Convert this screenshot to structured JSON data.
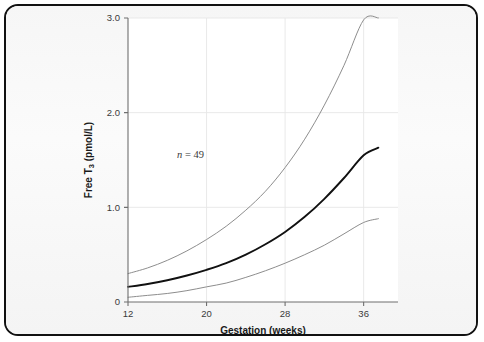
{
  "figure": {
    "border_color": "#111111",
    "plot_background": "#ffffff",
    "panel_background": "#f6f6f6"
  },
  "chart_data": {
    "type": "line",
    "title": "",
    "xlabel": "Gestation (weeks)",
    "ylabel": "Free T₃ (pmol/L)",
    "ylabel_main": "Free T",
    "ylabel_sub": "3",
    "ylabel_units": " (pmol/L)",
    "xlim": [
      12,
      39.5
    ],
    "ylim": [
      0,
      3.0
    ],
    "xticks": [
      12,
      20,
      28,
      36
    ],
    "xtick_labels": [
      "12",
      "20",
      "28",
      "36"
    ],
    "yticks": [
      0,
      1.0,
      2.0,
      3.0
    ],
    "ytick_labels": [
      "0",
      "1.0",
      "2.0",
      "3.0"
    ],
    "grid": true,
    "legend": "none",
    "annotations": [
      {
        "name": "sample-size",
        "text": "n = 49",
        "text_italic_part": "n",
        "text_rest": " = 49",
        "x": 17.0,
        "y": 1.52
      }
    ],
    "x": [
      12,
      14,
      16,
      18,
      20,
      22,
      24,
      26,
      28,
      30,
      32,
      34,
      36,
      37.5,
      38.2
    ],
    "series": [
      {
        "name": "upper-reference-limit",
        "style": "thin",
        "color": "#8d8d8d",
        "width": 1.0,
        "values": [
          0.3,
          0.36,
          0.44,
          0.54,
          0.66,
          0.8,
          0.97,
          1.17,
          1.42,
          1.72,
          2.08,
          2.5,
          2.98,
          3.0,
          null
        ]
      },
      {
        "name": "median",
        "style": "bold",
        "color": "#111111",
        "width": 1.9,
        "values": [
          0.16,
          0.19,
          0.23,
          0.28,
          0.34,
          0.41,
          0.5,
          0.61,
          0.74,
          0.9,
          1.09,
          1.31,
          1.55,
          1.63,
          null
        ]
      },
      {
        "name": "lower-reference-limit",
        "style": "thin",
        "color": "#8d8d8d",
        "width": 1.0,
        "values": [
          0.05,
          0.07,
          0.09,
          0.12,
          0.16,
          0.2,
          0.26,
          0.33,
          0.41,
          0.5,
          0.6,
          0.72,
          0.84,
          0.88,
          null
        ]
      }
    ]
  }
}
